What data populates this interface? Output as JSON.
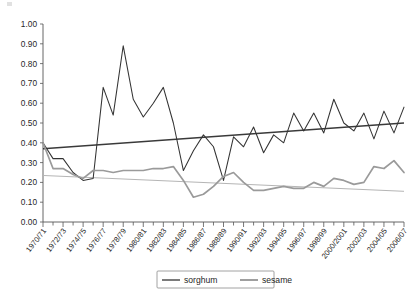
{
  "chart_data": {
    "type": "line",
    "title": "",
    "subtitle": "",
    "xlabel": "",
    "ylabel": "",
    "ylim": [
      0.0,
      1.0
    ],
    "ytick_step": 0.1,
    "grid": false,
    "legend_position": "bottom-center",
    "ytick_labels": [
      "0.00",
      "0.10",
      "0.20",
      "0.30",
      "0.40",
      "0.50",
      "0.60",
      "0.70",
      "0.80",
      "0.90",
      "1.00"
    ],
    "ytick_values": [
      0.0,
      0.1,
      0.2,
      0.3,
      0.4,
      0.5,
      0.6,
      0.7,
      0.8,
      0.9,
      1.0
    ],
    "categories": [
      "1970/71",
      "1971/72",
      "1972/73",
      "1973/74",
      "1974/75",
      "1975/76",
      "1976/77",
      "1977/78",
      "1978/79",
      "1979/80",
      "1980/81",
      "1981/82",
      "1982/83",
      "1983/84",
      "1984/85",
      "1985/86",
      "1986/87",
      "1987/88",
      "1988/89",
      "1989/90",
      "1990/91",
      "1991/92",
      "1992/93",
      "1993/94",
      "1994/95",
      "1995/96",
      "1996/97",
      "1997/98",
      "1998/99",
      "1999/2000",
      "2000/2001",
      "2001/02",
      "2002/03",
      "2003/04",
      "2004/05",
      "2005/06",
      "2006/07"
    ],
    "xtick_labels_shown": [
      "1970/71",
      "1972/73",
      "1974/75",
      "1976/77",
      "1978/79",
      "1980/81",
      "1982/83",
      "1984/85",
      "1986/87",
      "1988/89",
      "1990/91",
      "1992/93",
      "1994/95",
      "1996/97",
      "1998/99",
      "2000/2001",
      "2002/03",
      "2004/05",
      "2006/07"
    ],
    "series": [
      {
        "name": "sorghum",
        "color": "#333333",
        "values": [
          0.4,
          0.32,
          0.32,
          0.25,
          0.21,
          0.22,
          0.68,
          0.54,
          0.89,
          0.62,
          0.53,
          0.6,
          0.68,
          0.5,
          0.26,
          0.36,
          0.44,
          0.38,
          0.21,
          0.43,
          0.38,
          0.48,
          0.35,
          0.44,
          0.4,
          0.55,
          0.46,
          0.55,
          0.45,
          0.62,
          0.5,
          0.46,
          0.55,
          0.42,
          0.56,
          0.45,
          0.58
        ]
      },
      {
        "name": "sesame",
        "color": "#9a9a9a",
        "values": [
          0.4,
          0.27,
          0.27,
          0.24,
          0.22,
          0.26,
          0.26,
          0.25,
          0.26,
          0.26,
          0.26,
          0.27,
          0.27,
          0.28,
          0.21,
          0.125,
          0.14,
          0.18,
          0.23,
          0.25,
          0.2,
          0.16,
          0.16,
          0.17,
          0.18,
          0.17,
          0.17,
          0.2,
          0.18,
          0.22,
          0.21,
          0.19,
          0.2,
          0.28,
          0.27,
          0.31,
          0.25
        ]
      }
    ],
    "trendlines": [
      {
        "name": "sorghum-trend",
        "color": "#3a3a3a",
        "for_series": "sorghum",
        "y_start": 0.37,
        "y_end": 0.5,
        "direction": "increasing"
      },
      {
        "name": "sesame-trend",
        "color": "#b5b5b5",
        "for_series": "sesame",
        "y_start": 0.235,
        "y_end": 0.155,
        "direction": "decreasing"
      }
    ]
  },
  "legend": {
    "items": [
      {
        "label": "sorghum",
        "color": "#333333"
      },
      {
        "label": "sesame",
        "color": "#9a9a9a"
      }
    ]
  }
}
